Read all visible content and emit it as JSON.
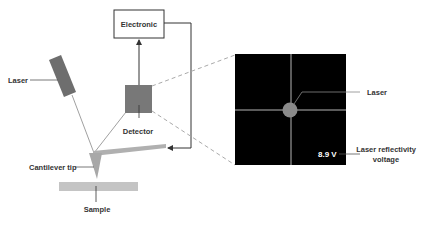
{
  "diagram": {
    "labels": {
      "electronic": "Electronic",
      "laser_source": "Laser",
      "detector": "Detector",
      "cantilever_tip": "Cantilever tip",
      "sample": "Sample",
      "laser_spot": "Laser",
      "voltage_value": "8.9 V",
      "voltage_label_line1": "Laser reflectivity",
      "voltage_label_line2": "voltage"
    },
    "colors": {
      "component_gray": "#7a7a7a",
      "light_gray": "#b5b5b5",
      "detector_panel": "#000000",
      "line": "#333333",
      "dashed": "#aaaaaa"
    }
  }
}
